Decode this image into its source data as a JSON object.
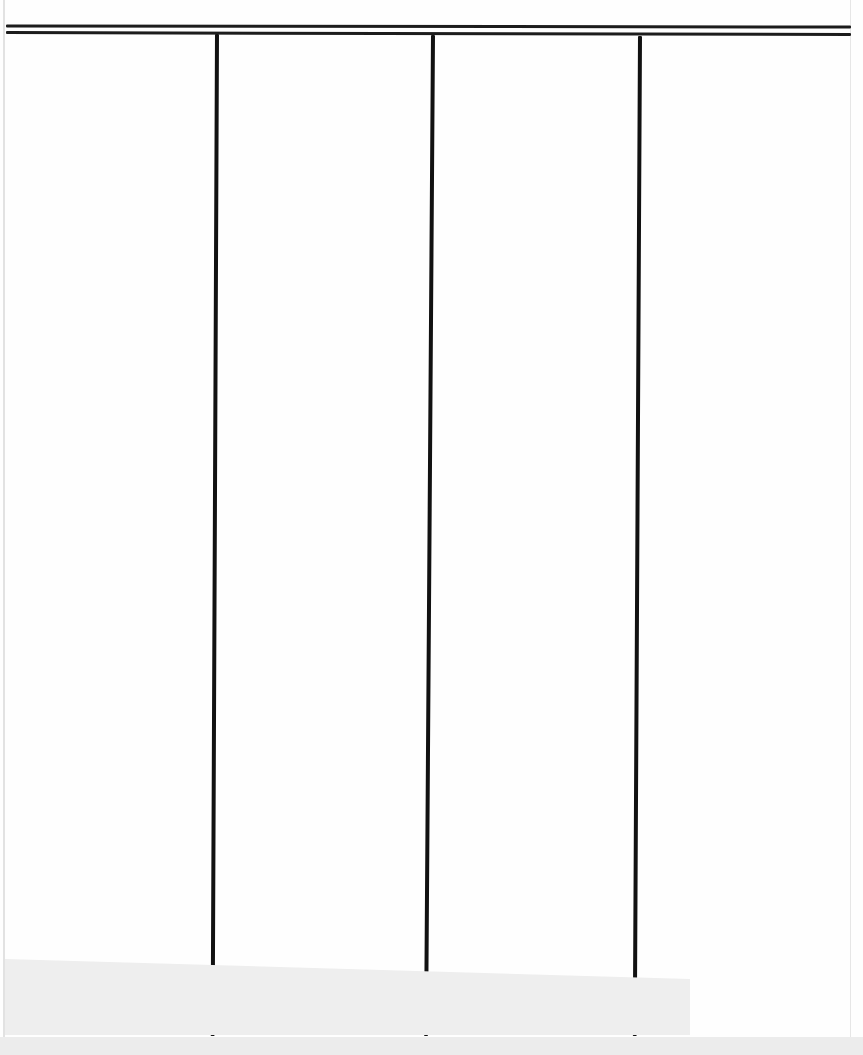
{
  "document": {
    "type": "blank ruled table form (scanned)",
    "columns": [
      {
        "index": 1,
        "header": "",
        "cells": []
      },
      {
        "index": 2,
        "header": "",
        "cells": []
      },
      {
        "index": 3,
        "header": "",
        "cells": []
      },
      {
        "index": 4,
        "header": "",
        "cells": []
      }
    ],
    "rules": {
      "top_double_rule": true,
      "vertical_dividers": 3
    },
    "colors": {
      "ink": "#111111",
      "paper": "#fefefe",
      "shadow_band": "#eeeeee"
    }
  }
}
